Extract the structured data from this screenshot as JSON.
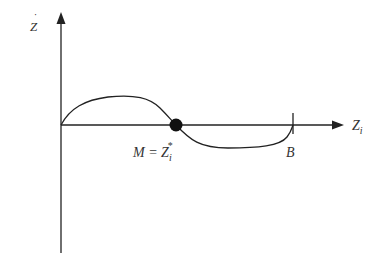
{
  "diagram": {
    "type": "phase-curve-sketch",
    "y_axis": {
      "label": "Ż",
      "label_base": "Z",
      "label_accent": "˙"
    },
    "x_axis": {
      "label": "Z",
      "label_sub": "i"
    },
    "points": {
      "M": {
        "label_prefix": "M = Z",
        "label_sub": "i",
        "label_sup": "*"
      },
      "B": {
        "label": "B"
      }
    },
    "colors": {
      "stroke": "#222222",
      "text": "#333333",
      "background": "#ffffff"
    }
  }
}
